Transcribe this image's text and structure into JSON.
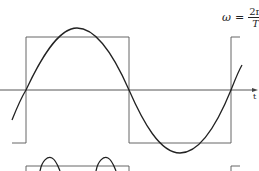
{
  "diagram": {
    "formula": {
      "lhs": "ω",
      "eq": "=",
      "numerator": "2π",
      "denominator": "T"
    },
    "axis_label": "t",
    "colors": {
      "stroke": "#222222",
      "background": "#ffffff"
    },
    "waves": [
      "sine wave",
      "square wave",
      "rectified sine (partial, lower)"
    ]
  }
}
